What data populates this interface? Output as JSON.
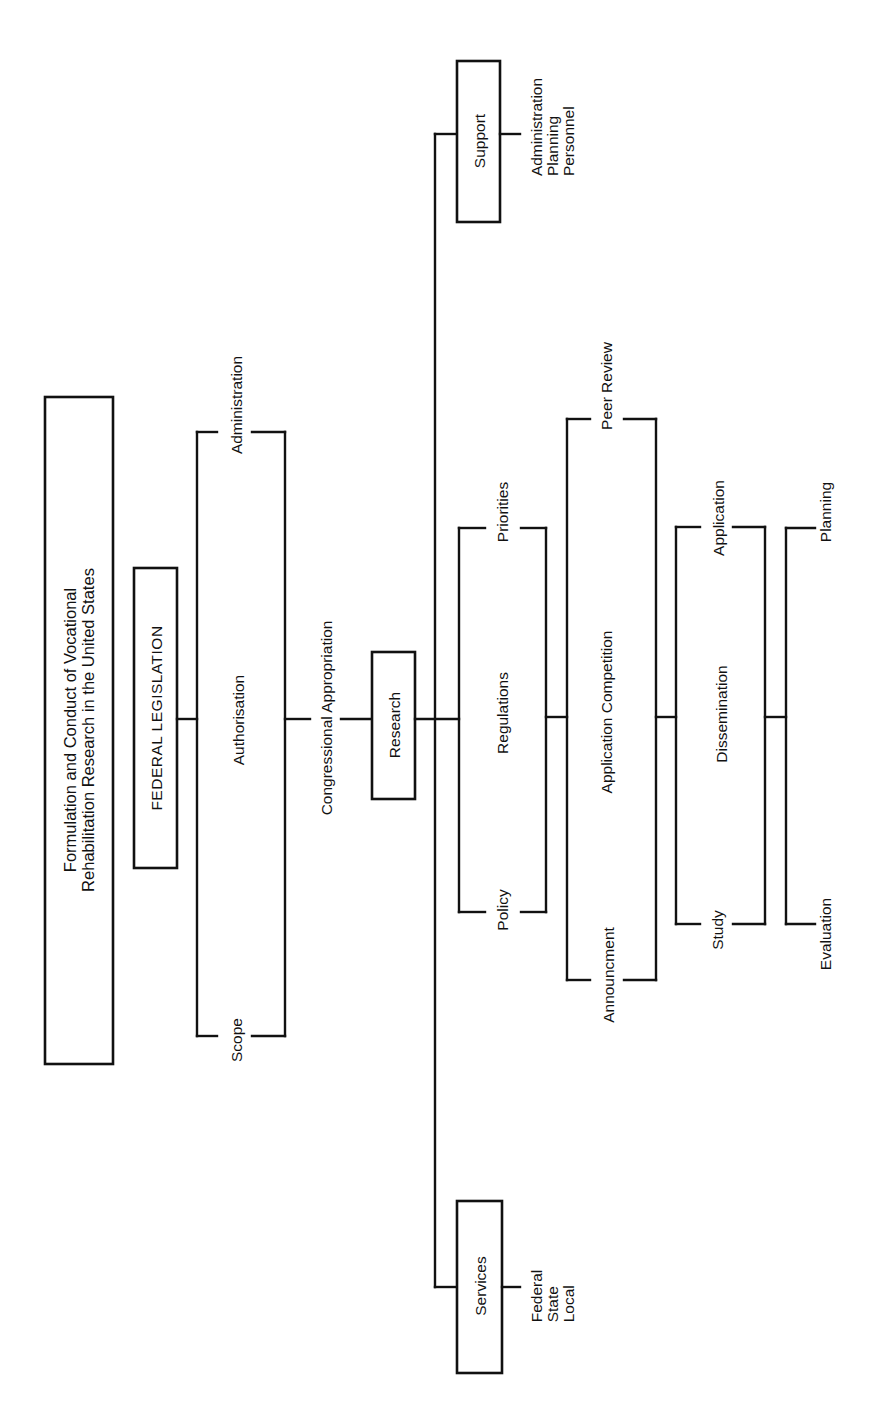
{
  "diagram": {
    "title_line1": "Formulation and Conduct of Vocational",
    "title_line2": "Rehabilitation Research in the United States",
    "root": {
      "label": "FEDERAL  LEGISLATION"
    },
    "legislation_bracket": {
      "top": "Administration",
      "middle": "Authorisation",
      "bottom": "Scope"
    },
    "appropriation": {
      "label": "Congressional Appropriation"
    },
    "research": {
      "label": "Research"
    },
    "support": {
      "label": "Support",
      "items": [
        "Administration",
        "Planning",
        "Personnel"
      ],
      "items_text": "Administration\nPlanning\nPersonnel"
    },
    "services": {
      "label": "Services",
      "items": [
        "Federal",
        "State",
        "Local"
      ],
      "items_text": "Federal\nState\nLocal"
    },
    "policy_bracket": {
      "top": "Priorities",
      "middle": "Regulations",
      "bottom": "Policy"
    },
    "competition_bracket": {
      "top": "Peer Review",
      "middle": "Application Competition",
      "bottom": "Announcment"
    },
    "dissemination_bracket": {
      "top": "Application",
      "middle": "Dissemination",
      "bottom": "Study"
    },
    "evaluation_bracket": {
      "top": "Planning",
      "bottom": "Evaluation"
    },
    "colors": {
      "line": "#111111",
      "background": "#ffffff"
    }
  }
}
